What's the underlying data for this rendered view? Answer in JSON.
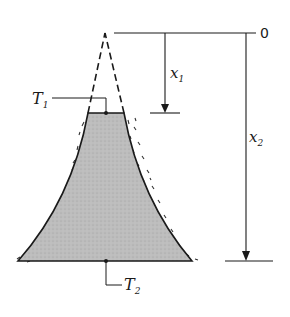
{
  "diagram": {
    "type": "tapered-fin-conduction",
    "labels": {
      "origin": "0",
      "x1": {
        "base": "x",
        "sub": "1"
      },
      "x2": {
        "base": "x",
        "sub": "2"
      },
      "T1": {
        "base": "T",
        "sub": "1"
      },
      "T2": {
        "base": "T",
        "sub": "2"
      }
    },
    "colors": {
      "line": "#1a1a1a",
      "fill": "#b8b8b8",
      "insulation": "#333333",
      "background": "#ffffff"
    }
  }
}
